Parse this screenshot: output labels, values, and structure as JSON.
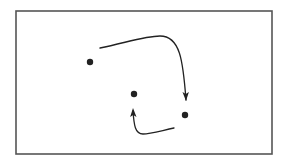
{
  "diagram": {
    "frame": {
      "x": 16,
      "y": 11,
      "width": 256,
      "height": 143,
      "stroke": "#555555",
      "stroke_width": 1.6
    },
    "colors": {
      "ink": "#222222"
    },
    "nodes": [
      {
        "id": "dot-1",
        "cx": 90,
        "cy": 62,
        "r": 3.2
      },
      {
        "id": "dot-2",
        "cx": 134,
        "cy": 94,
        "r": 3.2
      },
      {
        "id": "dot-3",
        "cx": 185,
        "cy": 115,
        "r": 3.2
      }
    ],
    "arrows": [
      {
        "id": "arrow-1",
        "path": "M100,48 C125,43 145,36 160,36 C180,36 183,60 186,100",
        "head": {
          "tip": [
            186,
            101
          ],
          "angle": 88
        }
      },
      {
        "id": "arrow-2",
        "path": "M174,128 C160,131 150,134 143,134 C135,134 134,125 133,111",
        "head": {
          "tip": [
            133,
            108
          ],
          "angle": -92
        }
      }
    ]
  }
}
